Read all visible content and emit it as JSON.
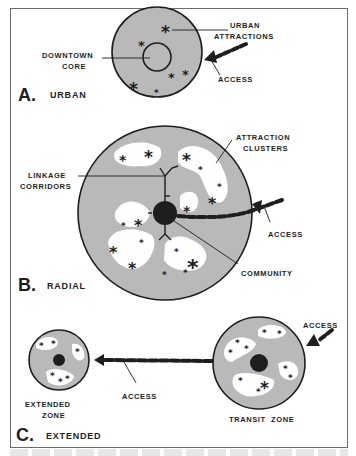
{
  "colors": {
    "zone_fill": "#b9b9b9",
    "cluster_fill": "#ffffff",
    "outline": "#1e1e1e",
    "frame_border": "#6b6b6b"
  },
  "diagram": {
    "panels": [
      {
        "id": "A",
        "letter": "A.",
        "title": "URBAN",
        "labels": {
          "attractions": [
            "URBAN",
            "ATTRACTIONS"
          ],
          "core": [
            "DOWNTOWN",
            "CORE"
          ],
          "access": "ACCESS"
        }
      },
      {
        "id": "B",
        "letter": "B.",
        "title": "RADIAL",
        "labels": {
          "clusters": [
            "ATTRACTION",
            "CLUSTERS"
          ],
          "corridors": [
            "LINKAGE",
            "CORRIDORS"
          ],
          "access": "ACCESS",
          "community": "COMMUNITY"
        }
      },
      {
        "id": "C",
        "letter": "C.",
        "title": "EXTENDED",
        "labels": {
          "extended_zone": [
            "EXTENDED",
            "ZONE"
          ],
          "access_middle": "ACCESS",
          "access_top": "ACCESS",
          "transit_zone": "TRANSIT  ZONE"
        }
      }
    ],
    "symbols": {
      "attraction": "*"
    }
  }
}
